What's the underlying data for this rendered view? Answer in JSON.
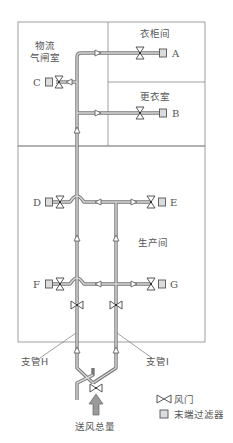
{
  "diagram": {
    "type": "air-supply-duct-schematic",
    "rooms": {
      "material_airlock": {
        "line1": "物流",
        "line2": "气闸室"
      },
      "locker_room": "衣柜间",
      "changing_room": "更衣室",
      "production_room": "生产间"
    },
    "outlets": {
      "A": "A",
      "B": "B",
      "C": "C",
      "D": "D",
      "E": "E",
      "F": "F",
      "G": "G"
    },
    "branches": {
      "H": "支管H",
      "I": "支管I"
    },
    "main_supply": "送风总量",
    "legend": {
      "damper": "风门",
      "terminal_filter": "末端过滤器"
    },
    "colors": {
      "line": "#777777",
      "pipe_fill": "#d8d8d8",
      "filter_fill": "#dcdcdc",
      "text": "#555555"
    }
  }
}
